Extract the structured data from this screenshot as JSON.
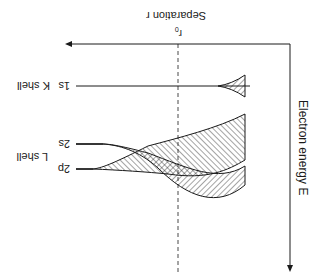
{
  "diagram": {
    "x_axis_label": "Separation r",
    "r0_label": "r",
    "r0_subscript": "0",
    "y_axis_label": "Electron energy E",
    "levels": [
      {
        "id": "1s",
        "label": "1s",
        "shell": "K shell"
      },
      {
        "id": "2s",
        "label": "2s",
        "shell": "L shell"
      },
      {
        "id": "2p",
        "label": "2p",
        "shell": ""
      }
    ],
    "colors": {
      "ink": "#1a1a1a",
      "background": "#ffffff"
    }
  }
}
